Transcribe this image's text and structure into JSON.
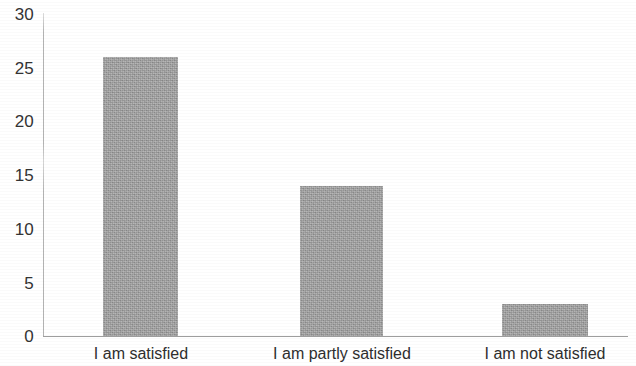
{
  "chart_data": {
    "type": "bar",
    "title": "",
    "subtitle": "",
    "xlabel": "",
    "ylabel": "",
    "categories": [
      "I am satisfied",
      "I am partly satisfied",
      "I am not satisfied"
    ],
    "values": [
      26,
      14,
      3
    ],
    "series": [
      {
        "name": "Responses",
        "values": [
          26,
          14,
          3
        ]
      }
    ],
    "ylim": [
      0,
      30
    ],
    "ytick_labels": [
      "0",
      "5",
      "10",
      "15",
      "20",
      "25",
      "30"
    ],
    "ytick_values": [
      0,
      5,
      10,
      15,
      20,
      25,
      30
    ],
    "grid": false,
    "legend": false,
    "legend_position": "none",
    "bar_color": "#9a9a9a",
    "axis_color": "#a8a8a8",
    "text_color": "#2e2e2e",
    "background_color": "#ffffff"
  },
  "axes": {
    "y_ticks": [
      {
        "label": "30",
        "value": 30
      },
      {
        "label": "25",
        "value": 25
      },
      {
        "label": "20",
        "value": 20
      },
      {
        "label": "15",
        "value": 15
      },
      {
        "label": "10",
        "value": 10
      },
      {
        "label": "5",
        "value": 5
      },
      {
        "label": "0",
        "value": 0
      }
    ],
    "x_ticks": [
      {
        "label": "I am satisfied"
      },
      {
        "label": "I am partly satisfied"
      },
      {
        "label": "I am not satisfied"
      }
    ]
  },
  "bars": [
    {
      "category": "I am satisfied",
      "value": 26
    },
    {
      "category": "I am partly satisfied",
      "value": 14
    },
    {
      "category": "I am not satisfied",
      "value": 3
    }
  ]
}
